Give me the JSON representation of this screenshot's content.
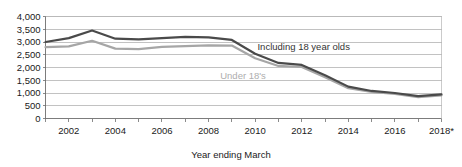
{
  "chart_data": {
    "type": "line",
    "title": "",
    "xlabel": "Year ending March",
    "ylabel": "",
    "xlim": [
      2001,
      2018
    ],
    "ylim": [
      0,
      4000
    ],
    "grid": true,
    "legend_position": "inline-annotation",
    "x": [
      2001,
      2002,
      2003,
      2004,
      2005,
      2006,
      2007,
      2008,
      2009,
      2010,
      2011,
      2012,
      2013,
      2014,
      2015,
      2016,
      2017,
      2018
    ],
    "x_tick_labels": [
      "2002",
      "2004",
      "2006",
      "2008",
      "2010",
      "2012",
      "2014",
      "2016",
      "2018*"
    ],
    "x_tick_values": [
      2002,
      2004,
      2006,
      2008,
      2010,
      2012,
      2014,
      2016,
      2018
    ],
    "y_tick_labels": [
      "0",
      "500",
      "1,000",
      "1,500",
      "2,000",
      "2,500",
      "3,000",
      "3,500",
      "4,000"
    ],
    "y_tick_values": [
      0,
      500,
      1000,
      1500,
      2000,
      2500,
      3000,
      3500,
      4000
    ],
    "series": [
      {
        "name": "Including 18 year olds",
        "color": "#4a4a4a",
        "width": 2.2,
        "label_x": 2010.1,
        "label_y": 2690,
        "values": [
          3000,
          3150,
          3450,
          3130,
          3100,
          3150,
          3200,
          3180,
          3080,
          2540,
          2180,
          2100,
          1700,
          1250,
          1080,
          1000,
          880,
          950
        ]
      },
      {
        "name": "Under 18's",
        "color": "#a6a6a6",
        "width": 2.2,
        "label_x": 2008.5,
        "label_y": 1560,
        "values": [
          2800,
          2830,
          3050,
          2740,
          2720,
          2810,
          2840,
          2870,
          2860,
          2360,
          2060,
          2020,
          1620,
          1190,
          1040,
          960,
          840,
          910
        ]
      }
    ]
  },
  "axis": {
    "x_title": "Year ending March"
  }
}
